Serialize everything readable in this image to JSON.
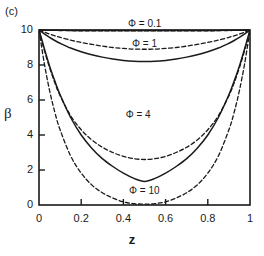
{
  "panel": {
    "label": "(c)"
  },
  "chart_data": {
    "type": "line",
    "title": "",
    "subtitle": "",
    "xlabel": "z",
    "ylabel": "β",
    "xlim": [
      0,
      1
    ],
    "ylim": [
      0,
      10
    ],
    "xticks": [
      "0",
      "0.2",
      "0.4",
      "0.6",
      "0.8",
      "1"
    ],
    "xtick_values": [
      0,
      0.2,
      0.4,
      0.6,
      0.8,
      1
    ],
    "yticks": [
      "0",
      "2",
      "4",
      "6",
      "8",
      "10"
    ],
    "ytick_values": [
      0,
      2,
      4,
      6,
      8,
      10
    ],
    "grid": false,
    "legend_position": "inline-annotations",
    "annotations": [
      {
        "text": "Φ = 0.1",
        "x": 0.5,
        "y": 10.35
      },
      {
        "text": "Φ = 1",
        "x": 0.5,
        "y": 9.25
      },
      {
        "text": "Φ = 4",
        "x": 0.47,
        "y": 5.2
      },
      {
        "text": "Φ = 10",
        "x": 0.5,
        "y": 0.85
      }
    ],
    "x": [
      0,
      0.025,
      0.05,
      0.075,
      0.1,
      0.15,
      0.2,
      0.25,
      0.3,
      0.35,
      0.4,
      0.45,
      0.5,
      0.55,
      0.6,
      0.65,
      0.7,
      0.75,
      0.8,
      0.85,
      0.9,
      0.925,
      0.95,
      0.975,
      1
    ],
    "series": [
      {
        "name": "Φ = 0.1 (solid)",
        "phi": 0.1,
        "style": "solid",
        "min_value": 9.97,
        "values": [
          10,
          9.995,
          9.99,
          9.986,
          9.982,
          9.977,
          9.973,
          9.971,
          9.97,
          9.97,
          9.97,
          9.97,
          9.97,
          9.97,
          9.97,
          9.97,
          9.97,
          9.971,
          9.973,
          9.977,
          9.982,
          9.986,
          9.99,
          9.995,
          10
        ]
      },
      {
        "name": "Φ = 0.1 (dashed)",
        "phi": 0.1,
        "style": "dashed",
        "min_value": 9.95,
        "values": [
          10,
          9.99,
          9.982,
          9.975,
          9.969,
          9.961,
          9.956,
          9.952,
          9.95,
          9.95,
          9.95,
          9.95,
          9.95,
          9.95,
          9.95,
          9.95,
          9.95,
          9.952,
          9.956,
          9.961,
          9.969,
          9.975,
          9.982,
          9.99,
          10
        ]
      },
      {
        "name": "Φ = 1 (dashed)",
        "phi": 1,
        "style": "dashed",
        "min_value": 8.9,
        "values": [
          10,
          9.88,
          9.77,
          9.67,
          9.58,
          9.42,
          9.29,
          9.18,
          9.08,
          9.0,
          8.95,
          8.91,
          8.9,
          8.91,
          8.95,
          9.0,
          9.08,
          9.18,
          9.29,
          9.42,
          9.58,
          9.67,
          9.77,
          9.88,
          10
        ]
      },
      {
        "name": "Φ = 1 (solid)",
        "phi": 1,
        "style": "solid",
        "min_value": 8.2,
        "values": [
          10,
          9.78,
          9.58,
          9.4,
          9.24,
          8.97,
          8.76,
          8.59,
          8.45,
          8.34,
          8.26,
          8.21,
          8.2,
          8.21,
          8.26,
          8.34,
          8.45,
          8.59,
          8.76,
          8.97,
          9.24,
          9.4,
          9.58,
          9.78,
          10
        ]
      },
      {
        "name": "Φ = 4 (dashed)",
        "phi": 4,
        "style": "dashed",
        "min_value": 2.6,
        "values": [
          10,
          8.85,
          7.85,
          6.98,
          6.25,
          5.1,
          4.3,
          3.72,
          3.3,
          3.0,
          2.78,
          2.65,
          2.6,
          2.65,
          2.78,
          3.0,
          3.3,
          3.72,
          4.3,
          5.1,
          6.25,
          6.98,
          7.85,
          8.85,
          10
        ]
      },
      {
        "name": "Φ = 4 (solid)",
        "phi": 4,
        "style": "solid",
        "min_value": 1.35,
        "values": [
          10,
          8.95,
          7.95,
          7.08,
          6.3,
          5.0,
          4.0,
          3.25,
          2.65,
          2.2,
          1.82,
          1.52,
          1.35,
          1.52,
          1.82,
          2.2,
          2.65,
          3.25,
          4.0,
          5.0,
          6.3,
          7.08,
          7.95,
          8.95,
          10
        ]
      },
      {
        "name": "Φ = 10 (dashed)",
        "phi": 10,
        "style": "dashed",
        "min_value": 0.05,
        "values": [
          10,
          8.1,
          6.55,
          5.3,
          4.3,
          2.8,
          1.82,
          1.15,
          0.7,
          0.4,
          0.18,
          0.08,
          0.05,
          0.08,
          0.18,
          0.4,
          0.7,
          1.15,
          1.82,
          2.8,
          4.3,
          5.3,
          6.55,
          8.1,
          10
        ]
      }
    ]
  }
}
